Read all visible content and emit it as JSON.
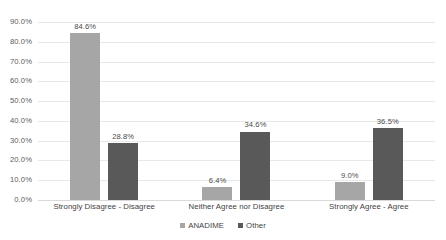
{
  "chart_data": {
    "type": "bar",
    "title": "",
    "subtitle": "",
    "xlabel": "",
    "ylabel": "",
    "ylim": [
      0,
      90
    ],
    "ytick_step": 10,
    "ytick_labels": [
      "90.0%",
      "80.0%",
      "70.0%",
      "60.0%",
      "50.0%",
      "40.0%",
      "30.0%",
      "20.0%",
      "10.0%",
      "0.0%"
    ],
    "ytick_values": [
      90,
      80,
      70,
      60,
      50,
      40,
      30,
      20,
      10,
      0
    ],
    "grid": true,
    "grid_axis": "y",
    "legend_position": "bottom-center",
    "categories": [
      "Strongly Disagree - Disagree",
      "Neither Agree nor Disagree",
      "Strongly Agree - Agree"
    ],
    "series": [
      {
        "name": "ANADIME",
        "color": "#a6a6a6",
        "values": [
          84.6,
          6.4,
          9.0
        ],
        "data_labels": [
          "84.6%",
          "6.4%",
          "9.0%"
        ]
      },
      {
        "name": "Other",
        "color": "#595959",
        "values": [
          28.8,
          34.6,
          36.5
        ],
        "data_labels": [
          "28.8%",
          "34.6%",
          "36.5%"
        ]
      }
    ]
  },
  "legend": {
    "items": [
      {
        "label": "ANADIME",
        "color": "#a6a6a6"
      },
      {
        "label": "Other",
        "color": "#595959"
      }
    ]
  },
  "colors": {
    "background": "#ffffff",
    "gridline": "#e8e8e8",
    "axis": "#d9d9d9",
    "tick_text": "#5a5a5a",
    "label_text": "#3f3f3f",
    "series_anadime": "#a6a6a6",
    "series_other": "#595959"
  }
}
